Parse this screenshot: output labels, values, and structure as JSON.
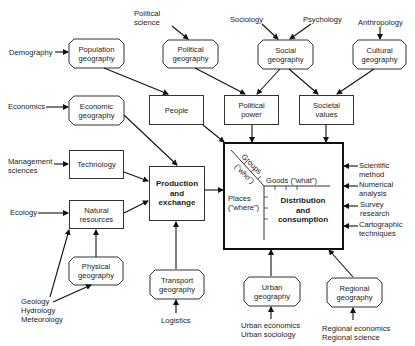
{
  "diagram": {
    "disciplines": {
      "political_science": "Political\nscience",
      "sociology": "Sociology",
      "psychology": "Psychology",
      "anthropology": "Anthropology",
      "demography": "Demography",
      "economics": "Economics",
      "management_sciences": "Management\nsciences",
      "ecology": "Ecology",
      "geology_group": "Geology\nHydrology\nMeteorology",
      "logistics": "Logistics",
      "urban_disciplines": "Urban economics\nUrban sociology",
      "regional_disciplines": "Regional economics\nRegional science"
    },
    "geographies": {
      "population": "Population\ngeography",
      "political": "Political\ngeography",
      "social": "Social\ngeography",
      "cultural": "Cultural\ngeography",
      "economic": "Economic\ngeography",
      "physical": "Physical\ngeography",
      "transport": "Transport\ngeography",
      "urban": "Urban\ngeography",
      "regional": "Regional\ngeography"
    },
    "factors": {
      "people": "People",
      "political_power": "Political\npower",
      "societal_values": "Societal\nvalues",
      "technology": "Technology",
      "natural_resources": "Natural\nresources",
      "production": "Production\nand\nexchange"
    },
    "central": {
      "title": "Distribution\nand\nconsumption",
      "groups": "Groups",
      "who": "(\"who\")",
      "goods": "Goods (\"what\")",
      "places": "Places\n(\"where\")"
    },
    "methods": {
      "scientific": "Scientific\nmethod",
      "numerical": "Numerical\nanalysis",
      "survey": "Survey\nresearch",
      "cartographic": "Cartographic\ntechniques"
    }
  }
}
